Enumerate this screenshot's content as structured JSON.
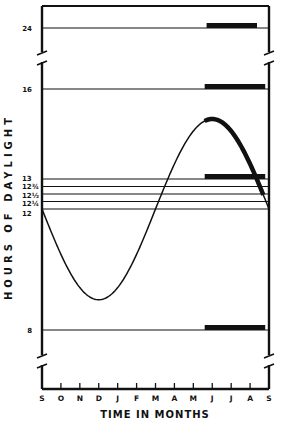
{
  "chart_data": {
    "type": "line",
    "title": "",
    "xlabel": "TIME IN MONTHS",
    "ylabel": "HOURS OF DAYLIGHT",
    "x_tick_labels": [
      "S",
      "O",
      "N",
      "D",
      "J",
      "F",
      "M",
      "A",
      "M",
      "J",
      "J",
      "A",
      "S"
    ],
    "y_tick_labels": [
      {
        "value": 24,
        "label": "24"
      },
      {
        "value": 16,
        "label": "16"
      },
      {
        "value": 13,
        "label": "13"
      },
      {
        "value": 12.75,
        "label": "12¾"
      },
      {
        "value": 12.5,
        "label": "12½"
      },
      {
        "value": 12.25,
        "label": "12¼"
      },
      {
        "value": 12,
        "label": "12"
      },
      {
        "value": 8,
        "label": "8"
      }
    ],
    "axis_breaks": [
      "between 16 and 24",
      "below 8"
    ],
    "grid": false,
    "series": [
      {
        "name": "Natural daylength",
        "style": "thin line, thickened between late May and mid August",
        "x_months_from_sept": [
          0,
          1,
          2,
          3,
          4,
          5,
          6,
          7,
          8,
          9,
          10,
          11,
          12
        ],
        "values": [
          12.0,
          10.5,
          9.4,
          9.0,
          9.4,
          10.5,
          12.0,
          13.5,
          14.6,
          15.0,
          14.6,
          13.5,
          12.0
        ],
        "highlight_range_months": [
          8.6,
          11.7
        ]
      }
    ],
    "constant_lines": [
      24,
      16,
      13,
      12.75,
      12.5,
      12.25,
      12,
      8
    ],
    "treatment_bars": [
      {
        "hours": 24,
        "start_month": 8.7,
        "end_month": 12.0
      },
      {
        "hours": 16,
        "start_month": 8.6,
        "end_month": 11.8
      },
      {
        "hours": 13,
        "start_month": 8.6,
        "end_month": 11.8
      },
      {
        "hours": 8,
        "start_month": 8.6,
        "end_month": 11.8
      }
    ],
    "colors": {
      "ink": "#111111",
      "background": "#ffffff"
    }
  }
}
